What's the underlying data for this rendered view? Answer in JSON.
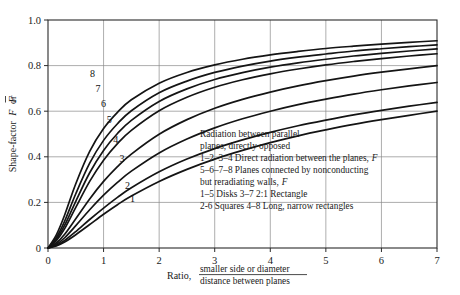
{
  "chart_data": {
    "type": "line",
    "title": "",
    "xlabel": "Ratio, smaller side or diameter / distance between planes",
    "xlabel_prefix": "Ratio,",
    "xlabel_numerator": "smaller side or diameter",
    "xlabel_denominator": "distance between planes",
    "ylabel": "Shape-factor F or F̅",
    "ylabel_plain": "Shape-factor",
    "ylabel_sym1": "F",
    "ylabel_or": "or",
    "ylabel_sym2": "F̅",
    "xlim": [
      0,
      7
    ],
    "ylim": [
      0,
      1.0
    ],
    "xticks": [
      0,
      1,
      2,
      3,
      4,
      5,
      6,
      7
    ],
    "xticklabels": [
      "0",
      "1",
      "2",
      "3",
      "4",
      "5",
      "6",
      "7"
    ],
    "yticks": [
      0,
      0.2,
      0.4,
      0.6,
      0.8,
      1.0
    ],
    "yticklabels": [
      "0",
      "0.2",
      "0.4",
      "0.6",
      "0.8",
      "1.0"
    ],
    "grid": true,
    "grid_color": "#808080",
    "curve_color": "#141414",
    "legend_position": "inside-right-middle",
    "x": [
      0,
      0.15,
      0.3,
      0.5,
      0.75,
      1.0,
      1.25,
      1.5,
      2.0,
      2.5,
      3.0,
      3.5,
      4.0,
      4.5,
      5.0,
      5.5,
      6.0,
      6.5,
      7.0
    ],
    "series": [
      {
        "name": "1",
        "label": "1",
        "label_x": 1.52,
        "label_y": 0.215,
        "description": "Direct radiation between the planes, Disks",
        "values": [
          0,
          0.009,
          0.026,
          0.058,
          0.103,
          0.148,
          0.19,
          0.228,
          0.292,
          0.345,
          0.39,
          0.428,
          0.462,
          0.492,
          0.518,
          0.542,
          0.563,
          0.582,
          0.6
        ]
      },
      {
        "name": "2",
        "label": "2",
        "label_x": 1.43,
        "label_y": 0.272,
        "description": "Direct radiation between the planes, Squares",
        "values": [
          0,
          0.012,
          0.033,
          0.072,
          0.125,
          0.175,
          0.222,
          0.264,
          0.334,
          0.39,
          0.436,
          0.474,
          0.507,
          0.536,
          0.561,
          0.584,
          0.604,
          0.622,
          0.639
        ]
      },
      {
        "name": "3",
        "label": "3",
        "label_x": 1.33,
        "label_y": 0.393,
        "description": "Direct radiation between the planes, 2:1 Rectangle",
        "values": [
          0,
          0.016,
          0.045,
          0.098,
          0.168,
          0.232,
          0.288,
          0.337,
          0.417,
          0.478,
          0.527,
          0.567,
          0.6,
          0.629,
          0.653,
          0.675,
          0.694,
          0.711,
          0.726
        ]
      },
      {
        "name": "4",
        "label": "4",
        "label_x": 1.22,
        "label_y": 0.475,
        "description": "Direct radiation between the planes, Long, narrow rectangles",
        "values": [
          0,
          0.022,
          0.06,
          0.128,
          0.215,
          0.292,
          0.357,
          0.412,
          0.499,
          0.563,
          0.613,
          0.652,
          0.684,
          0.711,
          0.734,
          0.754,
          0.771,
          0.786,
          0.8
        ]
      },
      {
        "name": "5",
        "label": "5",
        "label_x": 1.1,
        "label_y": 0.562,
        "description": "Planes connected by nonconducting but reradiating walls, Disks",
        "values": [
          0,
          0.032,
          0.085,
          0.178,
          0.292,
          0.385,
          0.458,
          0.516,
          0.602,
          0.661,
          0.705,
          0.738,
          0.764,
          0.785,
          0.803,
          0.818,
          0.831,
          0.842,
          0.852
        ]
      },
      {
        "name": "6",
        "label": "6",
        "label_x": 1.0,
        "label_y": 0.635,
        "description": "Planes connected by nonconducting but reradiating walls, Squares",
        "values": [
          0,
          0.038,
          0.1,
          0.205,
          0.33,
          0.428,
          0.502,
          0.56,
          0.643,
          0.698,
          0.739,
          0.769,
          0.793,
          0.812,
          0.828,
          0.842,
          0.854,
          0.864,
          0.873
        ]
      },
      {
        "name": "7",
        "label": "7",
        "label_x": 0.9,
        "label_y": 0.7,
        "description": "Planes connected by nonconducting but reradiating walls, 2:1 Rectangle",
        "values": [
          0,
          0.046,
          0.118,
          0.238,
          0.372,
          0.472,
          0.545,
          0.602,
          0.681,
          0.732,
          0.77,
          0.798,
          0.82,
          0.837,
          0.851,
          0.864,
          0.874,
          0.883,
          0.891
        ]
      },
      {
        "name": "8",
        "label": "8",
        "label_x": 0.8,
        "label_y": 0.765,
        "description": "Planes connected by nonconducting but reradiating walls, Long, narrow rectangles",
        "values": [
          0,
          0.058,
          0.145,
          0.282,
          0.424,
          0.524,
          0.595,
          0.65,
          0.723,
          0.77,
          0.803,
          0.828,
          0.847,
          0.862,
          0.875,
          0.885,
          0.894,
          0.902,
          0.909
        ]
      }
    ],
    "annotations": {
      "legend_lines": [
        "Radiation between parallel",
        "planes, directly opposed",
        "1–2–3–4 Direct radiation between the planes, F",
        "5–6–7–8 Planes connected by nonconducting",
        "but reradiating walls, F",
        "1–5 Disks 3–7 2:1 Rectangle",
        "2-6 Squares 4–8 Long, narrow rectangles"
      ]
    }
  },
  "legend": {
    "line1": "Radiation between parallel",
    "line2": "planes, directly opposed",
    "line3_pre": "1–2–3–4 Direct radiation between the planes,",
    "line3_sym": "F",
    "line4": "5–6–7–8 Planes connected by nonconducting",
    "line5_pre": "but reradiating walls,",
    "line5_sym": "F",
    "line6": "1–5 Disks 3–7 2:1 Rectangle",
    "line7": "2-6 Squares 4–8 Long, narrow rectangles"
  }
}
